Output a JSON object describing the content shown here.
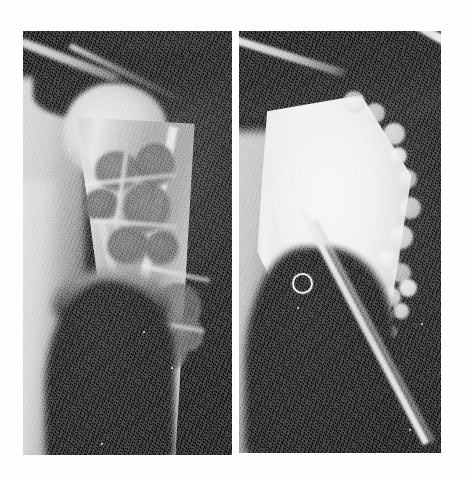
{
  "figure": {
    "kind": "radiograph-figure",
    "caption": "",
    "background_color": "#ffffff",
    "width": 467,
    "height": 478,
    "panel_count": 2
  },
  "panels": [
    {
      "id": "panel-left",
      "position_label": "left",
      "modality": "plain radiograph",
      "anatomy": "proximal humerus, shoulder (AP view)",
      "phase_label": "preoperative",
      "findings": "expansile multiloculated lytic lesion of the proximal humeral metaphysis with soap-bubble septations and thinned cortex",
      "background_color": "#101010",
      "bone_color": "#dcdcdc",
      "lesion_color": "#5f5f5f",
      "geometry": {
        "x": 23,
        "y": 31,
        "width": 209,
        "height": 424
      },
      "locules": [
        {
          "x": 72,
          "y": 120,
          "w": 44,
          "h": 40
        },
        {
          "x": 112,
          "y": 112,
          "w": 40,
          "h": 44
        },
        {
          "x": 60,
          "y": 158,
          "w": 36,
          "h": 32
        },
        {
          "x": 100,
          "y": 152,
          "w": 48,
          "h": 50
        },
        {
          "x": 84,
          "y": 196,
          "w": 42,
          "h": 38
        },
        {
          "x": 122,
          "y": 200,
          "w": 34,
          "h": 34
        },
        {
          "x": 132,
          "y": 252,
          "w": 46,
          "h": 48
        },
        {
          "x": 122,
          "y": 300,
          "w": 42,
          "h": 40
        },
        {
          "x": 150,
          "y": 286,
          "w": 30,
          "h": 34
        }
      ],
      "septations": [
        {
          "x": 62,
          "y": 146,
          "w": 92,
          "h": 5,
          "rot": -6
        },
        {
          "x": 70,
          "y": 190,
          "w": 86,
          "h": 5,
          "rot": 4
        },
        {
          "x": 96,
          "y": 120,
          "w": 5,
          "h": 78,
          "rot": 8
        },
        {
          "x": 118,
          "y": 240,
          "w": 70,
          "h": 5,
          "rot": 12
        },
        {
          "x": 118,
          "y": 292,
          "w": 64,
          "h": 5,
          "rot": 10
        }
      ],
      "specks": [
        {
          "x": 46,
          "y": 118,
          "d": 2
        },
        {
          "x": 120,
          "y": 300,
          "d": 2
        },
        {
          "x": 148,
          "y": 336,
          "d": 2
        },
        {
          "x": 78,
          "y": 412,
          "d": 2
        }
      ]
    },
    {
      "id": "panel-right",
      "position_label": "right",
      "modality": "plain radiograph",
      "anatomy": "proximal humerus, shoulder (AP view)",
      "phase_label": "postoperative",
      "findings": "cavity curetted and packed with dense radiopaque graft/cement filling the proximal humeral metaphysis; granular bubbly graft material at the distal margin; small radiopaque ring marker projected over soft tissue",
      "background_color": "#0e0e0e",
      "graft_color": "#f1f1f1",
      "geometry": {
        "x": 239,
        "y": 31,
        "width": 202,
        "height": 422
      },
      "ring_marker": {
        "cx": 61,
        "cy": 250,
        "d": 17
      },
      "graft_bubbles": [
        {
          "x": 104,
          "y": 60,
          "d": 22
        },
        {
          "x": 126,
          "y": 72,
          "d": 20
        },
        {
          "x": 144,
          "y": 92,
          "d": 22
        },
        {
          "x": 150,
          "y": 116,
          "d": 18
        },
        {
          "x": 158,
          "y": 138,
          "d": 20
        },
        {
          "x": 160,
          "y": 166,
          "d": 22
        },
        {
          "x": 150,
          "y": 194,
          "d": 24
        },
        {
          "x": 138,
          "y": 218,
          "d": 22
        },
        {
          "x": 152,
          "y": 232,
          "d": 20
        },
        {
          "x": 126,
          "y": 240,
          "d": 22
        },
        {
          "x": 142,
          "y": 256,
          "d": 20
        },
        {
          "x": 160,
          "y": 248,
          "d": 18
        },
        {
          "x": 118,
          "y": 262,
          "d": 18
        },
        {
          "x": 136,
          "y": 276,
          "d": 18
        },
        {
          "x": 154,
          "y": 272,
          "d": 16
        },
        {
          "x": 110,
          "y": 280,
          "d": 16
        },
        {
          "x": 126,
          "y": 292,
          "d": 15
        },
        {
          "x": 144,
          "y": 294,
          "d": 14
        },
        {
          "x": 118,
          "y": 304,
          "d": 13
        }
      ],
      "specks": [
        {
          "x": 58,
          "y": 276,
          "d": 2
        },
        {
          "x": 182,
          "y": 292,
          "d": 2
        },
        {
          "x": 170,
          "y": 398,
          "d": 2
        }
      ]
    }
  ]
}
